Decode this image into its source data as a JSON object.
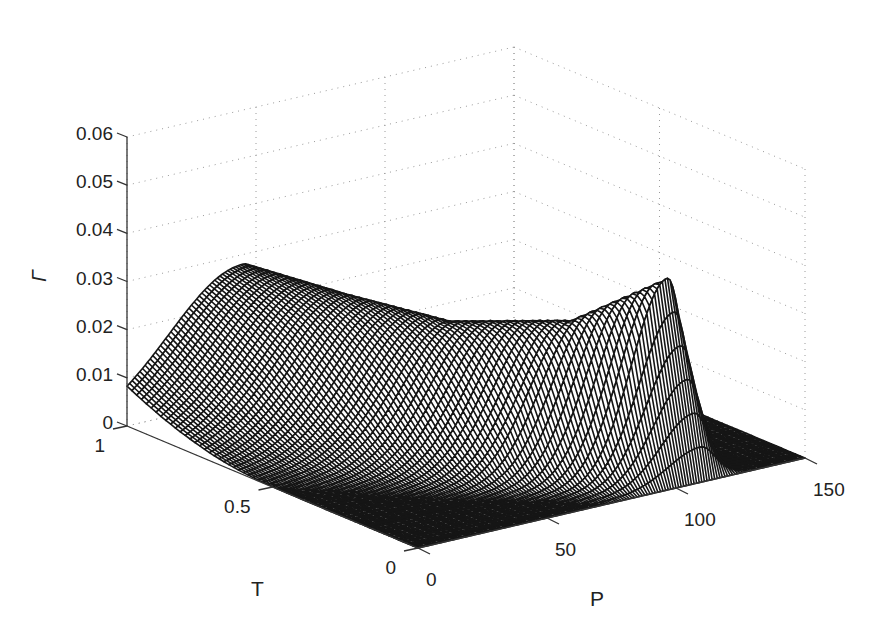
{
  "chart_data": {
    "type": "surface3d",
    "title": "",
    "xlabel": "P",
    "ylabel": "T",
    "zlabel": "Γ",
    "xlim": [
      0,
      150
    ],
    "ylim": [
      0,
      1
    ],
    "zlim": [
      0,
      0.06
    ],
    "x_ticks": [
      0,
      50,
      100,
      150
    ],
    "x_tick_labels": [
      "0",
      "50",
      "100",
      "150"
    ],
    "y_ticks": [
      0,
      0.5,
      1
    ],
    "y_tick_labels": [
      "0",
      "0.5",
      "1"
    ],
    "z_ticks": [
      0,
      0.01,
      0.02,
      0.03,
      0.04,
      0.05,
      0.06
    ],
    "z_tick_labels": [
      "0",
      "0.01",
      "0.02",
      "0.03",
      "0.04",
      "0.05",
      "0.06"
    ],
    "grid": "dotted",
    "style": "black wireframe mesh, white faces",
    "surface_description": "Single ridge in P whose location shifts with T: broad smooth ridge near P≈45 at T=1 (height ≈0.028), moving to larger P as T decreases, becoming a sharp peak near P≈108, T≈0.12 (height ≈0.040), zero elsewhere.",
    "ridge_samples": [
      {
        "T": 1.0,
        "P_center": 45,
        "height": 0.028
      },
      {
        "T": 0.75,
        "P_center": 55,
        "height": 0.027
      },
      {
        "T": 0.5,
        "P_center": 68,
        "height": 0.026
      },
      {
        "T": 0.25,
        "P_center": 88,
        "height": 0.03
      },
      {
        "T": 0.1,
        "P_center": 108,
        "height": 0.04
      },
      {
        "T": 0.0,
        "P_center": 112,
        "height": 0.0
      }
    ],
    "mesh_rows_T": 60,
    "mesh_cols_P": 150
  },
  "labels": {
    "x_axis": "P",
    "y_axis": "T",
    "z_axis": "Γ"
  }
}
